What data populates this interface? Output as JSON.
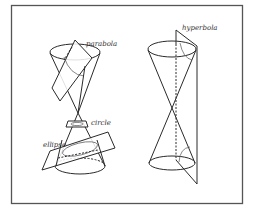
{
  "figure": {
    "labels": {
      "parabola": "parabola",
      "circle": "circle",
      "ellipse": "ellipse",
      "hyperbola": "hyperbola"
    },
    "colors": {
      "line": "#2a2a2a",
      "frame": "#555555",
      "background": "#ffffff"
    }
  }
}
